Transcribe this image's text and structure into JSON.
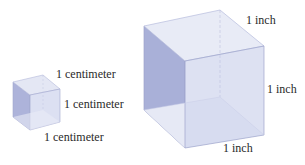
{
  "figure": {
    "small_cube": {
      "unit": "centimeter",
      "labels": {
        "top": "1 centimeter",
        "right": "1 centimeter",
        "bottom": "1 centimeter"
      }
    },
    "large_cube": {
      "unit": "inch",
      "labels": {
        "top": "1 inch",
        "right": "1 inch",
        "bottom": "1 inch"
      }
    },
    "colors": {
      "face_light": "#e6e9f5",
      "face_left": "#a9b0d8",
      "face_front": "#d3d8ee",
      "edge": "#9ea5cc"
    }
  }
}
